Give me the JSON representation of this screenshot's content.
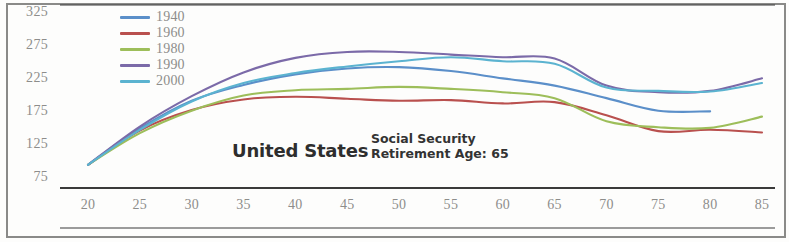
{
  "chart_data": {
    "type": "line",
    "title": "United States",
    "annotation": "Social Security\nRetirement Age: 65",
    "annotation_line1": "Social Security",
    "annotation_line2": "Retirement Age: 65",
    "xlabel": "",
    "ylabel": "",
    "grid": false,
    "legend_position": "top-left",
    "xlim": [
      20,
      85
    ],
    "ylim": [
      75,
      325
    ],
    "x_ticks": [
      20,
      25,
      30,
      35,
      40,
      45,
      50,
      55,
      60,
      65,
      70,
      75,
      80,
      85
    ],
    "y_ticks": [
      75,
      125,
      175,
      225,
      275,
      325
    ],
    "x": [
      20,
      25,
      30,
      35,
      40,
      45,
      50,
      55,
      60,
      65,
      70,
      75,
      80,
      85
    ],
    "series": [
      {
        "name": "1940",
        "color": "#5b8fc9",
        "x": [
          20,
          25,
          30,
          35,
          40,
          45,
          50,
          55,
          60,
          65,
          70,
          75,
          80
        ],
        "values": [
          95,
          150,
          192,
          216,
          232,
          241,
          243,
          237,
          226,
          215,
          196,
          177,
          176
        ]
      },
      {
        "name": "1960",
        "color": "#b9504e",
        "x": [
          20,
          25,
          30,
          35,
          40,
          45,
          50,
          55,
          60,
          65,
          70,
          75,
          80,
          85
        ],
        "values": [
          95,
          147,
          178,
          194,
          198,
          195,
          192,
          193,
          188,
          190,
          170,
          146,
          148,
          144
        ]
      },
      {
        "name": "1980",
        "color": "#9dbe5a",
        "x": [
          20,
          25,
          30,
          35,
          40,
          45,
          50,
          55,
          60,
          65,
          70,
          75,
          80,
          85
        ],
        "values": [
          95,
          143,
          177,
          200,
          208,
          210,
          213,
          210,
          205,
          196,
          161,
          152,
          151,
          168
        ]
      },
      {
        "name": "1990",
        "color": "#7b6aa8",
        "x": [
          20,
          25,
          30,
          35,
          40,
          45,
          50,
          55,
          60,
          65,
          70,
          75,
          80,
          85
        ],
        "values": [
          95,
          153,
          199,
          235,
          257,
          266,
          266,
          262,
          258,
          256,
          215,
          205,
          207,
          226
        ]
      },
      {
        "name": "2000",
        "color": "#5bb3d0",
        "x": [
          20,
          25,
          30,
          35,
          40,
          45,
          50,
          55,
          60,
          65,
          70,
          75,
          80,
          85
        ],
        "values": [
          95,
          148,
          191,
          219,
          234,
          244,
          252,
          258,
          252,
          248,
          212,
          207,
          206,
          219
        ]
      }
    ]
  },
  "axes": {
    "y_tick_labels": [
      "325",
      "275",
      "225",
      "175",
      "125",
      "75"
    ],
    "x_tick_labels": [
      "20",
      "25",
      "30",
      "35",
      "40",
      "45",
      "50",
      "55",
      "60",
      "65",
      "70",
      "75",
      "80",
      "85"
    ]
  },
  "legend": {
    "items": [
      {
        "label": "1940",
        "color": "#5b8fc9"
      },
      {
        "label": "1960",
        "color": "#b9504e"
      },
      {
        "label": "1980",
        "color": "#9dbe5a"
      },
      {
        "label": "1990",
        "color": "#7b6aa8"
      },
      {
        "label": "2000",
        "color": "#5bb3d0"
      }
    ]
  },
  "annotations": {
    "country": "United States",
    "note_line1": "Social Security",
    "note_line2": "Retirement Age: 65"
  },
  "style": {
    "axis_color": "#3a3a3a",
    "tick_label_color": "#8d8d8b",
    "frame_color": "#8a8a88",
    "background": "#fdfdfc"
  }
}
